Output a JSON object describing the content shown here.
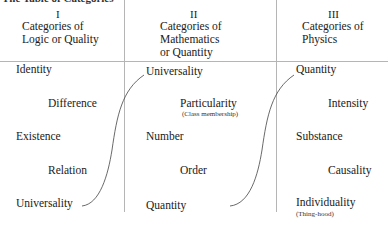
{
  "title": "The Table of Categories",
  "columns": [
    {
      "numeral": "I",
      "heading": [
        "Categories of",
        "Logic or Quality"
      ],
      "items": [
        {
          "label": "Identity"
        },
        {
          "label": "Difference"
        },
        {
          "label": "Existence"
        },
        {
          "label": "Relation"
        },
        {
          "label": "Universality"
        }
      ]
    },
    {
      "numeral": "II",
      "heading": [
        "Categories of",
        "Mathematics",
        "or Quantity"
      ],
      "items": [
        {
          "label": "Universality"
        },
        {
          "label": "Particularity",
          "note": "(Class membership)"
        },
        {
          "label": "Number"
        },
        {
          "label": "Order"
        },
        {
          "label": "Quantity"
        }
      ]
    },
    {
      "numeral": "III",
      "heading": [
        "Categories of",
        "Physics"
      ],
      "items": [
        {
          "label": "Quantity"
        },
        {
          "label": "Intensity"
        },
        {
          "label": "Substance"
        },
        {
          "label": "Causality"
        },
        {
          "label": "Individuality",
          "note": "(Thing-hood)"
        }
      ]
    }
  ],
  "connectors": [
    {
      "from": "I: Universality",
      "to": "II: Universality"
    },
    {
      "from": "II: Quantity",
      "to": "III: Quantity"
    }
  ]
}
